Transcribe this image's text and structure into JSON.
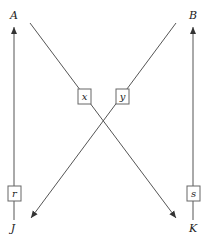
{
  "diagram": {
    "nodes": {
      "top_left": "A",
      "top_right": "B",
      "bottom_left": "J",
      "bottom_right": "K"
    },
    "edges": [
      {
        "from": "J",
        "to": "A",
        "label": "r"
      },
      {
        "from": "K",
        "to": "B",
        "label": "s"
      },
      {
        "from": "A",
        "to": "K",
        "label": "x"
      },
      {
        "from": "B",
        "to": "J",
        "label": "y"
      }
    ],
    "colors": {
      "line": "#555555",
      "text": "#222222"
    }
  }
}
